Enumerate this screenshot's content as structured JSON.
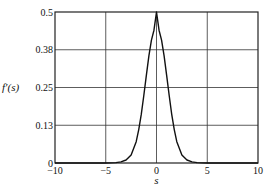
{
  "chart_data": {
    "type": "line",
    "title": "",
    "xlabel": "s",
    "ylabel": "f′(s)",
    "xlim": [
      -10,
      10
    ],
    "ylim": [
      0,
      0.5
    ],
    "xticks": [
      -10,
      -5,
      0,
      5,
      10
    ],
    "xtick_labels": [
      "−10",
      "−5",
      "0",
      "5",
      "10"
    ],
    "yticks": [
      0,
      0.125,
      0.25,
      0.375,
      0.5
    ],
    "ytick_labels": [
      "0",
      "0.13",
      "0.25",
      "0.38",
      "0.5"
    ],
    "grid": true,
    "legend": "none",
    "series": [
      {
        "name": "f′(s)",
        "color": "#111111",
        "x": [
          -10,
          -5,
          -4,
          -3.5,
          -3,
          -2.5,
          -2,
          -1.75,
          -1.5,
          -1.25,
          -1,
          -0.75,
          -0.5,
          -0.25,
          0,
          0.25,
          0.5,
          0.75,
          1,
          1.25,
          1.5,
          1.75,
          2,
          2.5,
          3,
          3.5,
          4,
          5,
          10
        ],
        "y": [
          0.0,
          0.0002,
          0.0013,
          0.0036,
          0.0099,
          0.0266,
          0.0707,
          0.1106,
          0.1608,
          0.2236,
          0.29,
          0.3546,
          0.4068,
          0.4397,
          0.5,
          0.4397,
          0.4068,
          0.3546,
          0.29,
          0.2236,
          0.1608,
          0.1106,
          0.0707,
          0.0266,
          0.0099,
          0.0036,
          0.0013,
          0.0002,
          0.0
        ]
      }
    ]
  }
}
